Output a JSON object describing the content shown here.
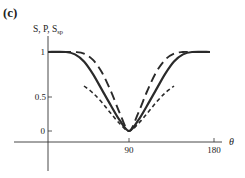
{
  "panel_label": "(c)",
  "chart_data": {
    "type": "line",
    "title": "",
    "ylabel": "S, P, S_sp",
    "ylabel_main": "S, P, S",
    "ylabel_sub": "sp",
    "xlabel": "θ",
    "xlim": [
      0,
      180
    ],
    "ylim": [
      -0.1,
      1.1
    ],
    "xticks": [
      90,
      180
    ],
    "xtick_labels": [
      "90",
      "180"
    ],
    "yticks": [
      0,
      0.5,
      1
    ],
    "ytick_labels": [
      "0",
      "0.5",
      "1"
    ],
    "grid": false,
    "legend": "none",
    "series": [
      {
        "name": "S",
        "style": "solid",
        "x": [
          0,
          20,
          30,
          40,
          50,
          60,
          70,
          80,
          90,
          100,
          110,
          120,
          130,
          140,
          150,
          160,
          180
        ],
        "y": [
          1.0,
          1.0,
          0.97,
          0.88,
          0.72,
          0.52,
          0.32,
          0.13,
          0.0,
          0.13,
          0.32,
          0.52,
          0.72,
          0.88,
          0.97,
          1.0,
          1.0
        ]
      },
      {
        "name": "P",
        "style": "long-dash",
        "x": [
          0,
          20,
          30,
          40,
          50,
          60,
          70,
          80,
          90,
          100,
          110,
          120,
          130,
          140,
          150,
          160,
          180
        ],
        "y": [
          1.0,
          1.0,
          1.0,
          0.98,
          0.9,
          0.74,
          0.5,
          0.22,
          0.0,
          0.22,
          0.5,
          0.74,
          0.9,
          0.98,
          1.0,
          1.0,
          1.0
        ]
      },
      {
        "name": "S_sp",
        "style": "short-dash",
        "x": [
          40,
          50,
          60,
          70,
          80,
          90,
          100,
          110,
          120,
          130,
          140
        ],
        "y": [
          0.57,
          0.48,
          0.36,
          0.22,
          0.09,
          0.0,
          0.09,
          0.22,
          0.36,
          0.48,
          0.57
        ]
      }
    ]
  }
}
